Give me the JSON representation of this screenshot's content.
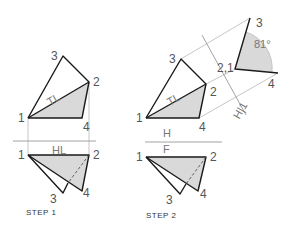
{
  "figure": {
    "steps": [
      {
        "id": "step1",
        "caption": "STEP 1",
        "top_view": {
          "labels": {
            "p1": "1",
            "p2": "2",
            "p3": "3",
            "p4": "4",
            "true_length": "TL"
          }
        },
        "fold_line_label": "HL",
        "front_view": {
          "labels": {
            "p1": "1",
            "p2": "2",
            "p3": "3",
            "p4": "4"
          }
        }
      },
      {
        "id": "step2",
        "caption": "STEP 2",
        "top_view": {
          "labels": {
            "p1": "1",
            "p2": "2",
            "p3": "3",
            "p4": "4",
            "true_length": "TL"
          }
        },
        "fold_line_top": "H",
        "fold_line_bottom": "F",
        "front_view": {
          "labels": {
            "p1": "1",
            "p2": "2",
            "p3": "3",
            "p4": "4"
          }
        },
        "auxiliary_view": {
          "labels": {
            "p21": "2,1",
            "p3": "3",
            "p4": "4"
          },
          "fold_line_label": "H|1",
          "dihedral_angle": "81°"
        }
      }
    ]
  }
}
